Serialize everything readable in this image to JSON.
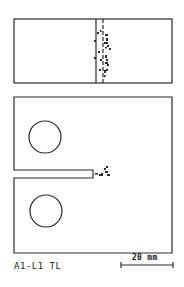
{
  "figure": {
    "specimen_label": "A1-L1 TL",
    "scale_bar": {
      "label": "20 mm"
    },
    "colors": {
      "line": "#2a2a2a",
      "background": "#ffffff"
    },
    "top_view": {
      "description": "Side (edge) view of specimen with crack front markings",
      "solid_line": "initial notch front",
      "dashed_line": "crack front position"
    },
    "front_view": {
      "description": "Compact tension specimen with two loading holes and machined notch",
      "holes": 2,
      "notch": "machined notch with crack extension at tip"
    }
  }
}
